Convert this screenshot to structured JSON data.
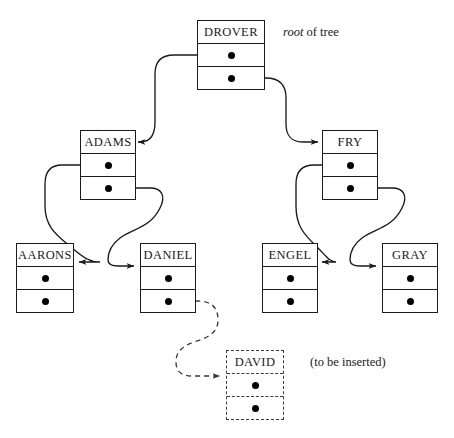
{
  "figure": {
    "type": "binary-search-tree-linked-representation",
    "title": "",
    "background_color": "#ffffff",
    "line_color": "#1a1a1a",
    "dot_color": "#000000",
    "ghost_color": "#3a3a3a"
  },
  "labels": {
    "root_label_italic": "root",
    "root_label_rest": " of tree",
    "insert_note": "(to be inserted)"
  },
  "nodes": [
    {
      "id": "drover",
      "key": "DROVER",
      "state": "existing",
      "x": 197,
      "y": 20,
      "w": 68,
      "h": 70,
      "left_pointer": "adams",
      "right_pointer": "fry"
    },
    {
      "id": "adams",
      "key": "ADAMS",
      "state": "existing",
      "x": 80,
      "y": 130,
      "w": 56,
      "h": 70,
      "left_pointer": "aarons",
      "right_pointer": "daniel"
    },
    {
      "id": "fry",
      "key": "FRY",
      "state": "existing",
      "x": 322,
      "y": 130,
      "w": 56,
      "h": 70,
      "left_pointer": "engel",
      "right_pointer": "gray"
    },
    {
      "id": "aarons",
      "key": "AARONS",
      "state": "existing",
      "x": 16,
      "y": 243,
      "w": 58,
      "h": 70,
      "left_pointer": null,
      "right_pointer": null
    },
    {
      "id": "daniel",
      "key": "DANIEL",
      "state": "existing",
      "x": 140,
      "y": 243,
      "w": 56,
      "h": 70,
      "left_pointer": null,
      "right_pointer": "david"
    },
    {
      "id": "engel",
      "key": "ENGEL",
      "state": "existing",
      "x": 262,
      "y": 243,
      "w": 56,
      "h": 70,
      "left_pointer": null,
      "right_pointer": null
    },
    {
      "id": "gray",
      "key": "GRAY",
      "state": "existing",
      "x": 382,
      "y": 243,
      "w": 56,
      "h": 70,
      "left_pointer": null,
      "right_pointer": null
    },
    {
      "id": "david",
      "key": "DAVID",
      "state": "to-be-inserted",
      "x": 226,
      "y": 350,
      "w": 58,
      "h": 70,
      "left_pointer": null,
      "right_pointer": null
    }
  ],
  "edges": [
    {
      "id": "drover-left-adams",
      "from": "drover",
      "slot": "left",
      "to": "adams",
      "style": "solid"
    },
    {
      "id": "drover-right-fry",
      "from": "drover",
      "slot": "right",
      "to": "fry",
      "style": "solid"
    },
    {
      "id": "adams-left-aarons",
      "from": "adams",
      "slot": "left",
      "to": "aarons",
      "style": "solid"
    },
    {
      "id": "adams-right-daniel",
      "from": "adams",
      "slot": "right",
      "to": "daniel",
      "style": "solid"
    },
    {
      "id": "fry-left-engel",
      "from": "fry",
      "slot": "left",
      "to": "engel",
      "style": "solid"
    },
    {
      "id": "fry-right-gray",
      "from": "fry",
      "slot": "right",
      "to": "gray",
      "style": "solid"
    },
    {
      "id": "daniel-right-david",
      "from": "daniel",
      "slot": "right",
      "to": "david",
      "style": "dashed"
    }
  ],
  "label_positions": {
    "root_of_tree": {
      "x": 283,
      "y": 25
    },
    "insert_note": {
      "x": 310,
      "y": 355
    }
  }
}
